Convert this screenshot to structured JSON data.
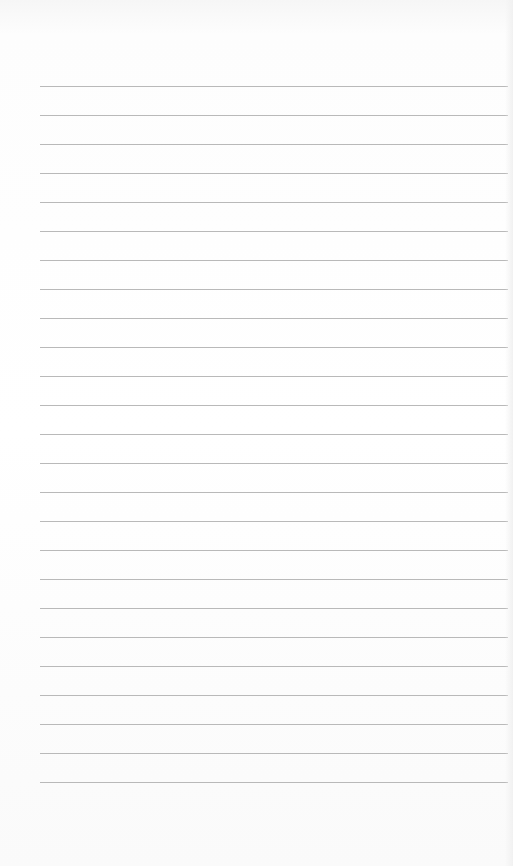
{
  "document": {
    "type": "lined-paper",
    "line_count": 25,
    "first_line_y": 86,
    "line_spacing": 29,
    "line_color": "#b9b9b9",
    "background_color": "#ffffff",
    "text": []
  }
}
